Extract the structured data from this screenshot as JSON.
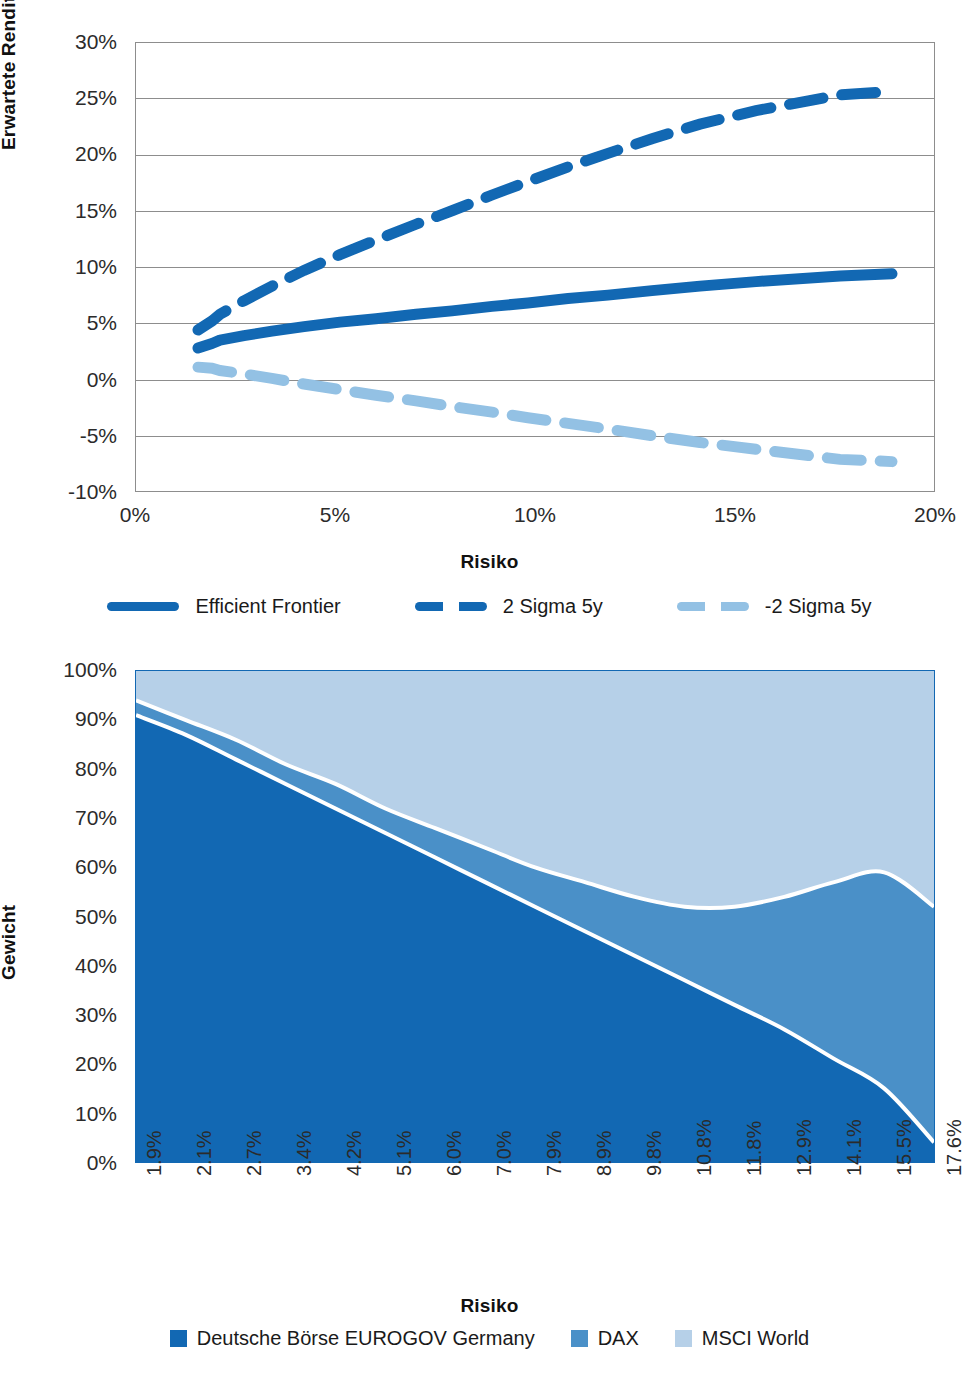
{
  "figure1": {
    "ytitle": "Erwartete Rendite",
    "xtitle": "Risiko",
    "yticks": [
      "30%",
      "25%",
      "20%",
      "15%",
      "10%",
      "5%",
      "0%",
      "-5%",
      "-10%"
    ],
    "xticks": [
      "0%",
      "5%",
      "10%",
      "15%",
      "20%"
    ],
    "legend": [
      {
        "label": "Efficient Frontier",
        "style": "solid",
        "color": "#1268b3"
      },
      {
        "label": "2 Sigma 5y",
        "style": "dashed",
        "color": "#1268b3"
      },
      {
        "label": "-2 Sigma 5y",
        "style": "dashed",
        "color": "#93c1e4"
      }
    ]
  },
  "figure2": {
    "ytitle": "Gewicht",
    "xtitle": "Risiko",
    "yticks": [
      "100%",
      "90%",
      "80%",
      "70%",
      "60%",
      "50%",
      "40%",
      "30%",
      "20%",
      "10%",
      "0%"
    ],
    "legend": [
      {
        "label": "Deutsche Börse EUROGOV Germany",
        "color": "#1268b3"
      },
      {
        "label": "DAX",
        "color": "#4a90c8"
      },
      {
        "label": "MSCI World",
        "color": "#b6d0e8"
      }
    ]
  },
  "caption": "",
  "colors": {
    "dark_blue": "#1268b3",
    "mid_blue": "#4a90c8",
    "light_blue": "#b6d0e8",
    "legend_light_line": "#93c1e4",
    "gridline": "#8d8d8d",
    "text": "#1a1a1a"
  },
  "chart_data": [
    {
      "type": "line",
      "title": "",
      "xlabel": "Risiko",
      "ylabel": "Erwartete Rendite",
      "xlim": [
        0,
        20
      ],
      "ylim": [
        -10,
        30
      ],
      "xtick_values": [
        0,
        5,
        10,
        15,
        20
      ],
      "ytick_values": [
        -10,
        -5,
        0,
        5,
        10,
        15,
        20,
        25,
        30
      ],
      "grid": true,
      "legend_position": "bottom",
      "x_unit": "percent",
      "y_unit": "percent",
      "x": [
        1.55,
        1.9,
        2.1,
        2.7,
        3.4,
        4.2,
        5.1,
        6.0,
        7.0,
        7.9,
        8.9,
        9.8,
        10.8,
        11.8,
        12.9,
        14.1,
        15.5,
        17.6,
        18.9
      ],
      "series": [
        {
          "name": "Efficient Frontier",
          "style": "solid",
          "color": "#1268b3",
          "values": [
            2.8,
            3.2,
            3.5,
            3.9,
            4.3,
            4.7,
            5.1,
            5.4,
            5.8,
            6.1,
            6.5,
            6.8,
            7.2,
            7.5,
            7.9,
            8.3,
            8.7,
            9.2,
            9.4
          ]
        },
        {
          "name": "2 Sigma 5y",
          "style": "dashed",
          "color": "#1268b3",
          "values": [
            4.4,
            5.2,
            5.8,
            7.0,
            8.3,
            9.7,
            11.1,
            12.4,
            13.8,
            15.0,
            16.4,
            17.6,
            18.9,
            20.1,
            21.4,
            22.7,
            23.9,
            25.3,
            25.6
          ]
        },
        {
          "name": "-2 Sigma 5y",
          "style": "dashed",
          "color": "#93c1e4",
          "values": [
            1.1,
            1.0,
            0.8,
            0.5,
            0.1,
            -0.4,
            -0.9,
            -1.4,
            -1.9,
            -2.4,
            -2.9,
            -3.4,
            -3.9,
            -4.4,
            -5.0,
            -5.6,
            -6.2,
            -7.1,
            -7.3
          ]
        }
      ]
    },
    {
      "type": "area",
      "stacked": true,
      "title": "",
      "xlabel": "Risiko",
      "ylabel": "Gewicht",
      "ylim": [
        0,
        100
      ],
      "y_unit": "percent",
      "grid": false,
      "legend_position": "bottom",
      "categories": [
        "1.9%",
        "2.1%",
        "2.7%",
        "3.4%",
        "4.2%",
        "5.1%",
        "6.0%",
        "7.0%",
        "7.9%",
        "8.9%",
        "9.8%",
        "10.8%",
        "11.8%",
        "12.9%",
        "14.1%",
        "15.5%",
        "17.6%"
      ],
      "series": [
        {
          "name": "Deutsche Börse EUROGOV Germany",
          "color": "#1268b3",
          "values": [
            91,
            87,
            82,
            77,
            72,
            67,
            62,
            57,
            52,
            47,
            42,
            37,
            32,
            27,
            21,
            15,
            4
          ]
        },
        {
          "name": "DAX",
          "color": "#4a90c8",
          "values": [
            3,
            3,
            4,
            4,
            5,
            5,
            6,
            7,
            8,
            10,
            12,
            15,
            20,
            27,
            36,
            44,
            48
          ]
        },
        {
          "name": "MSCI World",
          "color": "#b6d0e8",
          "values": [
            6,
            10,
            14,
            19,
            23,
            28,
            32,
            36,
            40,
            43,
            46,
            48,
            48,
            46,
            43,
            41,
            48
          ]
        }
      ]
    }
  ]
}
